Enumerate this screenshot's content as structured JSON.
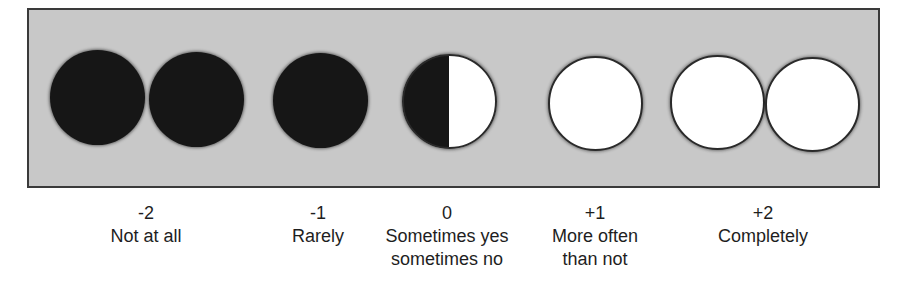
{
  "scale": {
    "panel": {
      "background": "#c8c8c8",
      "border": "#3a3a3a"
    },
    "dots": [
      {
        "fill": "filled",
        "color": "#161616"
      },
      {
        "fill": "filled",
        "color": "#161616"
      },
      {
        "fill": "filled",
        "color": "#161616"
      },
      {
        "fill": "half",
        "left_color": "#161616",
        "right_color": "#ffffff"
      },
      {
        "fill": "empty",
        "color": "#ffffff"
      },
      {
        "fill": "empty",
        "color": "#ffffff"
      },
      {
        "fill": "empty",
        "color": "#ffffff"
      }
    ],
    "labels": [
      {
        "value": "-2",
        "line1": "Not at all",
        "line2": ""
      },
      {
        "value": "-1",
        "line1": "Rarely",
        "line2": ""
      },
      {
        "value": "0",
        "line1": "Sometimes yes",
        "line2": "sometimes no"
      },
      {
        "value": "+1",
        "line1": "More often",
        "line2": "than not"
      },
      {
        "value": "+2",
        "line1": "Completely",
        "line2": ""
      }
    ]
  }
}
